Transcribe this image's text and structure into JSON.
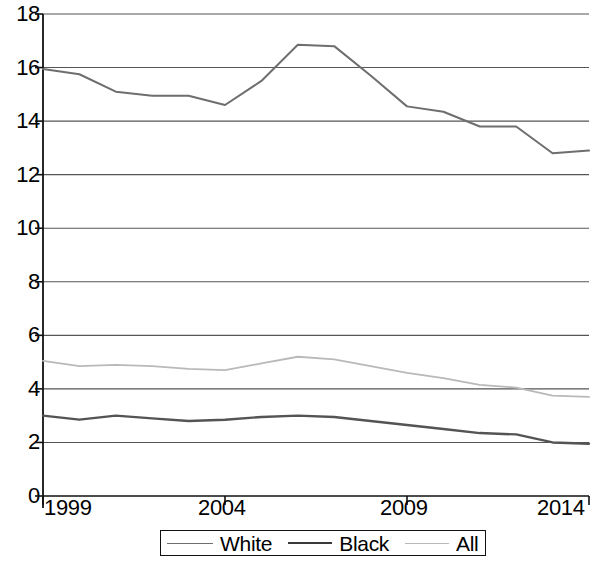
{
  "chart_data": {
    "type": "line",
    "title": "",
    "xlabel": "",
    "ylabel": "",
    "x": [
      1999,
      2000,
      2001,
      2002,
      2003,
      2004,
      2005,
      2006,
      2007,
      2008,
      2009,
      2010,
      2011,
      2012,
      2013,
      2014
    ],
    "xlim": [
      1999,
      2014
    ],
    "ylim": [
      0,
      18
    ],
    "y_ticks": [
      0,
      2,
      4,
      6,
      8,
      10,
      12,
      14,
      16,
      18
    ],
    "x_ticks": [
      1999,
      2004,
      2009,
      2014
    ],
    "x_tick_labels": [
      "1999",
      "2004",
      "2009",
      "2014"
    ],
    "y_tick_labels": [
      "0",
      "2",
      "4",
      "6",
      "8",
      "10",
      "12",
      "14",
      "16",
      "18"
    ],
    "grid": true,
    "grid_axis": "y",
    "legend_position": "bottom",
    "series": [
      {
        "name": "White",
        "color": "#6e6e6e",
        "width": 2.0,
        "values": [
          15.95,
          15.75,
          15.1,
          14.95,
          14.95,
          14.6,
          15.5,
          16.85,
          16.8,
          15.7,
          14.55,
          14.35,
          13.8,
          13.8,
          12.8,
          12.9
        ]
      },
      {
        "name": "Black",
        "color": "#545454",
        "width": 2.4,
        "values": [
          3.0,
          2.85,
          3.0,
          2.9,
          2.8,
          2.85,
          2.95,
          3.0,
          2.95,
          2.8,
          2.65,
          2.5,
          2.35,
          2.3,
          2.0,
          1.95
        ]
      },
      {
        "name": "All",
        "color": "#b9b9b9",
        "width": 1.8,
        "values": [
          5.05,
          4.85,
          4.9,
          4.85,
          4.75,
          4.7,
          4.95,
          5.2,
          5.1,
          4.85,
          4.6,
          4.4,
          4.15,
          4.05,
          3.75,
          3.7
        ]
      }
    ]
  },
  "legend": {
    "items": [
      {
        "label": "White",
        "swatch": "white-line-swatch"
      },
      {
        "label": "Black",
        "swatch": "black-line-swatch"
      },
      {
        "label": "All",
        "swatch": "all-line-swatch"
      }
    ]
  },
  "colors": {
    "axis": "#111111",
    "grid": "#555555",
    "background": "#ffffff"
  }
}
